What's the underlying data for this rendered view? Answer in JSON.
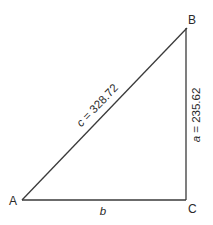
{
  "diagram": {
    "type": "right-triangle",
    "vertices": {
      "A": {
        "label": "A"
      },
      "B": {
        "label": "B"
      },
      "C": {
        "label": "C"
      }
    },
    "sides": {
      "hypotenuse": {
        "var": "c",
        "eq": " = ",
        "value": "328.72"
      },
      "vertical": {
        "var": "a",
        "eq": " = ",
        "value": "235.62"
      },
      "horizontal": {
        "var": "b"
      }
    },
    "colors": {
      "line": "#3a3a3a",
      "text": "#2a2a2a",
      "background": "#ffffff"
    }
  }
}
